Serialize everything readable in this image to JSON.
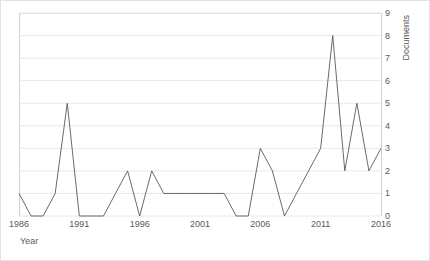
{
  "chart_data": {
    "type": "line",
    "title": "",
    "xlabel": "Year",
    "ylabel": "Documents",
    "x": [
      1986,
      1987,
      1988,
      1989,
      1990,
      1991,
      1992,
      1993,
      1994,
      1995,
      1996,
      1997,
      1998,
      1999,
      2000,
      2001,
      2002,
      2003,
      2004,
      2005,
      2006,
      2007,
      2008,
      2009,
      2010,
      2011,
      2012,
      2013,
      2014,
      2015,
      2016
    ],
    "values": [
      1,
      0,
      0,
      1,
      5,
      0,
      0,
      0,
      1,
      2,
      0,
      2,
      1,
      1,
      1,
      1,
      1,
      1,
      0,
      0,
      3,
      2,
      0,
      1,
      2,
      3,
      8,
      2,
      5,
      2,
      3
    ],
    "xlim": [
      1986,
      2016
    ],
    "ylim": [
      0,
      9
    ],
    "xticks": [
      1986,
      1991,
      1996,
      2001,
      2006,
      2011,
      2016
    ],
    "xtick_labels": [
      "1986",
      "1991",
      "1996",
      "2001",
      "2006",
      "2011",
      "2016"
    ],
    "yticks": [
      0,
      1,
      2,
      3,
      4,
      5,
      6,
      7,
      8,
      9
    ],
    "ytick_labels": [
      "0",
      "1",
      "2",
      "3",
      "4",
      "5",
      "6",
      "7",
      "8",
      "9"
    ],
    "grid": true,
    "grid_axis": "y",
    "legend": false,
    "y_axis_position": "right",
    "line_color": "#595959",
    "grid_color": "#e8e8e8",
    "axis_color": "#d0d0d0",
    "text_color": "#595959",
    "background_color": "#ffffff",
    "border_color": "#e3e3e3"
  }
}
